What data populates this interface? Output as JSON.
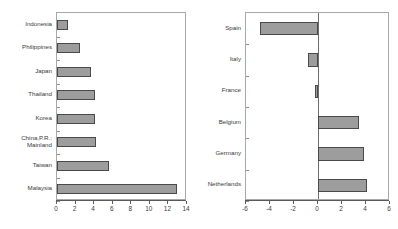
{
  "figure": {
    "type": "two-panel-horizontal-bar",
    "background_color": "#ffffff",
    "bar_fill_color": "#9d9d9d",
    "bar_edge_color": "#4a4a4a",
    "frame_color": "#a8a8a8"
  },
  "chart_data": [
    {
      "type": "bar",
      "orientation": "horizontal",
      "title": "",
      "xlabel": "",
      "ylabel": "",
      "xlim": [
        0,
        14
      ],
      "xticks": [
        0,
        2,
        4,
        6,
        8,
        10,
        12,
        14
      ],
      "xtick_labels": [
        "0",
        "2",
        "4",
        "6",
        "8",
        "10",
        "12",
        "14"
      ],
      "grid": false,
      "legend": "none",
      "categories": [
        "Indonesia",
        "Philippines",
        "Japan",
        "Thailand",
        "Korea",
        "China,P.R.:\nMainland",
        "Taiwan",
        "Malaysia"
      ],
      "values": [
        1.2,
        2.5,
        3.7,
        4.05,
        4.05,
        4.2,
        5.6,
        12.9
      ]
    },
    {
      "type": "bar",
      "orientation": "horizontal",
      "title": "",
      "xlabel": "",
      "ylabel": "",
      "xlim": [
        -6,
        6
      ],
      "xticks": [
        -6,
        -4,
        -2,
        0,
        2,
        4,
        6
      ],
      "xtick_labels": [
        "-6",
        "-4",
        "-2",
        "0",
        "2",
        "4",
        "6"
      ],
      "grid": false,
      "legend": "none",
      "zero_line": 0,
      "categories": [
        "Spain",
        "Italy",
        "France",
        "Belgium",
        "Germany",
        "Netherlands"
      ],
      "values": [
        -4.8,
        -0.8,
        -0.25,
        3.4,
        3.8,
        4.1
      ]
    }
  ]
}
